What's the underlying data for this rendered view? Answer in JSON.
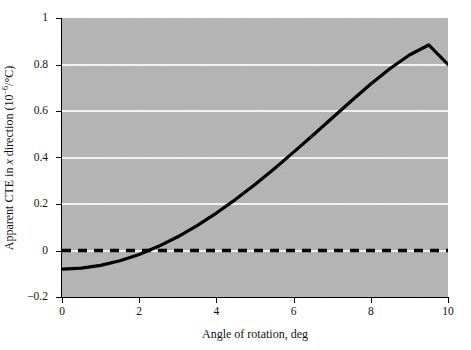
{
  "figure": {
    "background_color": "#ffffff",
    "plot_background_color": "#b4b4b4",
    "gridline_color": "#f2f2f2",
    "axis_color": "#000000",
    "curve_color": "#000000",
    "reference_line_color": "#000000"
  },
  "chart_data": {
    "type": "line",
    "title": "",
    "xlabel": "Angle of rotation, deg",
    "ylabel_parts": {
      "prefix": "Apparent CTE in ",
      "italic": "x",
      "suffix_before_sup": " direction (10",
      "superscript": "−6",
      "suffix_after_sup": "/°C)"
    },
    "ylabel": "Apparent CTE in x direction (10−6/°C)",
    "xlim": [
      0,
      10
    ],
    "ylim": [
      -0.2,
      1
    ],
    "xticks": [
      0,
      2,
      4,
      6,
      8,
      10
    ],
    "xticklabels": [
      "0",
      "2",
      "4",
      "6",
      "8",
      "10"
    ],
    "yticks": [
      1,
      0.8,
      0.6,
      0.4,
      0.2,
      0,
      -0.2
    ],
    "yticklabels": [
      "1",
      "0.8",
      "0.6",
      "0.4",
      "0.2",
      "0",
      "−0.2"
    ],
    "grid": true,
    "gridlines_y": [
      0.8,
      0.6,
      0.4,
      0.2,
      0
    ],
    "legend": null,
    "series": [
      {
        "name": "Apparent CTE in x direction",
        "style": "solid",
        "linewidth": 3,
        "x": [
          0,
          0.5,
          1,
          1.5,
          2,
          2.5,
          3,
          3.5,
          4,
          4.5,
          5,
          5.5,
          6,
          6.5,
          7,
          7.5,
          8,
          8.5,
          9,
          9.5,
          10
        ],
        "y": [
          -0.08,
          -0.076,
          -0.064,
          -0.044,
          -0.017,
          0.018,
          0.059,
          0.107,
          0.161,
          0.22,
          0.284,
          0.352,
          0.423,
          0.496,
          0.57,
          0.644,
          0.716,
          0.783,
          0.841,
          0.884,
          0.8
        ]
      },
      {
        "name": "Zero reference",
        "style": "dashed",
        "linewidth": 3,
        "x": [
          0,
          10
        ],
        "y": [
          0,
          0
        ]
      }
    ]
  }
}
